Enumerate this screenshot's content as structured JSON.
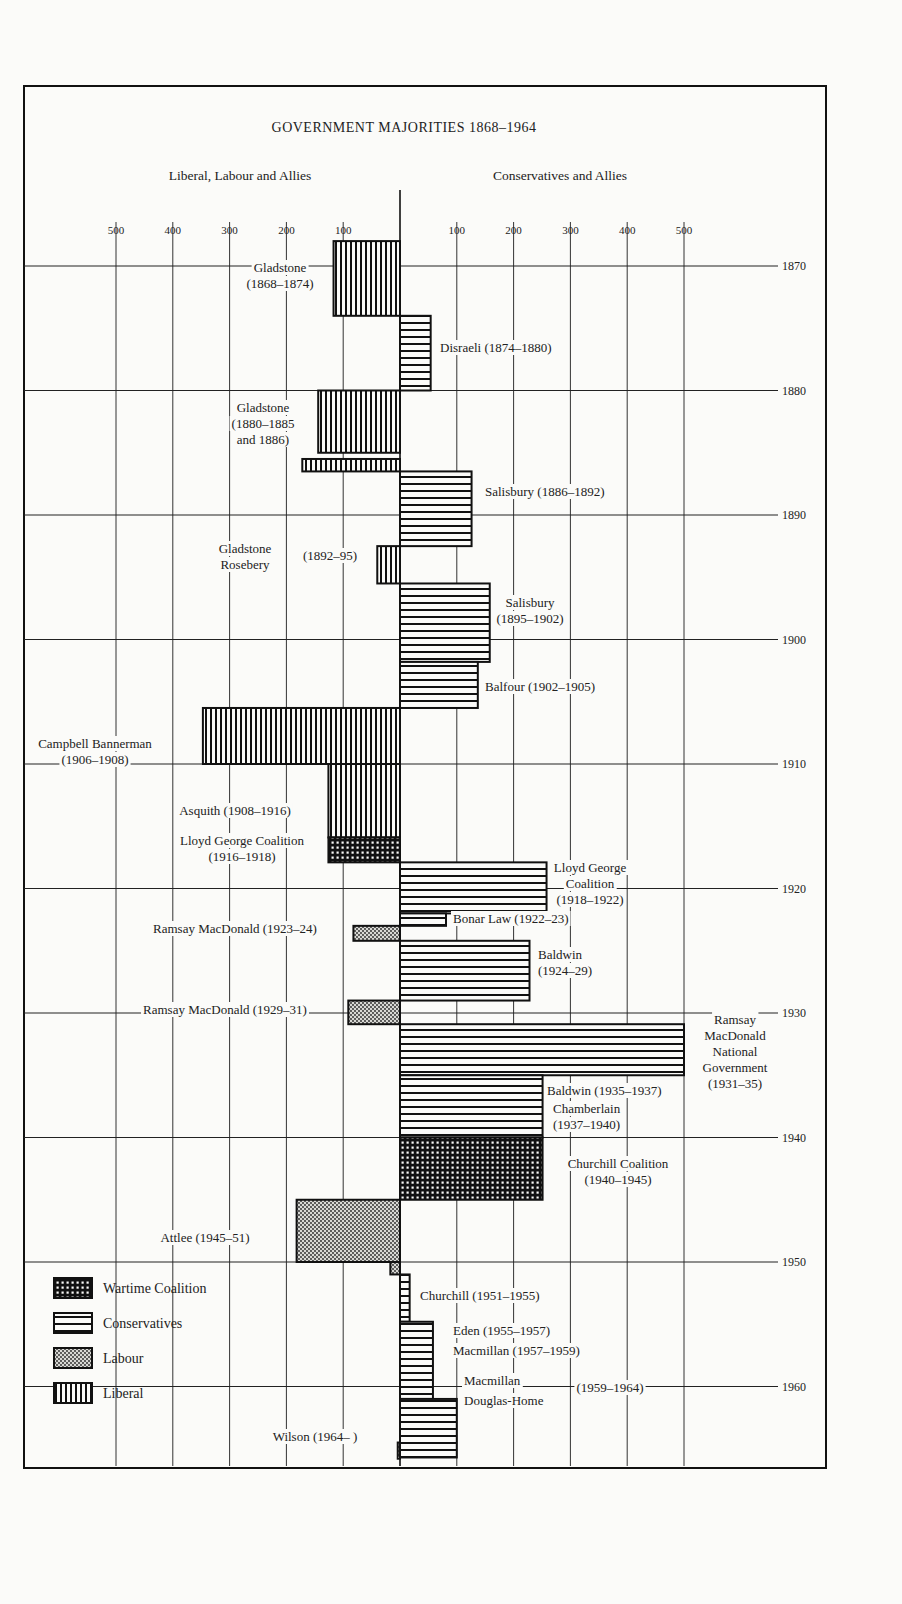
{
  "chart_data": {
    "type": "bar",
    "orientation": "horizontal-diverging",
    "title": "GOVERNMENT MAJORITIES 1868–1964",
    "left_heading": "Liberal, Labour and Allies",
    "right_heading": "Conservatives and Allies",
    "x_ticks_left": [
      500,
      400,
      300,
      200,
      100
    ],
    "x_ticks_right": [
      100,
      200,
      300,
      400,
      500
    ],
    "year_ticks": [
      1870,
      1880,
      1890,
      1900,
      1910,
      1920,
      1930,
      1940,
      1950,
      1960
    ],
    "xlim": [
      -600,
      600
    ],
    "ylim": [
      1868,
      1966
    ],
    "legend": [
      {
        "key": "wartime",
        "label": "Wartime Coalition"
      },
      {
        "key": "conservative",
        "label": "Conservatives"
      },
      {
        "key": "labour",
        "label": "Labour"
      },
      {
        "key": "liberal",
        "label": "Liberal"
      }
    ],
    "bars": [
      {
        "label": "Gladstone (1868–1874)",
        "start": 1868,
        "end": 1874,
        "side": "left",
        "majority": 117,
        "party": "liberal"
      },
      {
        "label": "Disraeli (1874–1880)",
        "start": 1874,
        "end": 1880,
        "side": "right",
        "majority": 54,
        "party": "conservative"
      },
      {
        "label": "Gladstone (1880–1885 and 1886)",
        "start": 1880,
        "end": 1885,
        "side": "left",
        "majority": 144,
        "party": "liberal"
      },
      {
        "label": "Gladstone (1886)",
        "start": 1885.5,
        "end": 1886.5,
        "side": "left",
        "majority": 172,
        "party": "liberal"
      },
      {
        "label": "Salisbury (1886–1892)",
        "start": 1886.5,
        "end": 1892.5,
        "side": "right",
        "majority": 126,
        "party": "conservative"
      },
      {
        "label": "Gladstone Rosebery (1892–95)",
        "start": 1892.5,
        "end": 1895.5,
        "side": "left",
        "majority": 40,
        "party": "liberal"
      },
      {
        "label": "Salisbury (1895–1902)",
        "start": 1895.5,
        "end": 1901.8,
        "side": "right",
        "majority": 158,
        "party": "conservative"
      },
      {
        "label": "Balfour (1902–1905)",
        "start": 1901.8,
        "end": 1905.5,
        "side": "right",
        "majority": 137,
        "party": "conservative"
      },
      {
        "label": "Campbell Bannerman (1906–1908)",
        "start": 1905.5,
        "end": 1910,
        "side": "left",
        "majority": 347,
        "party": "liberal"
      },
      {
        "label": "Asquith (1908–1916)",
        "start": 1910,
        "end": 1915.9,
        "side": "left",
        "majority": 126,
        "party": "liberal"
      },
      {
        "label": "Lloyd George Coalition (1916–1918)",
        "start": 1915.9,
        "end": 1917.9,
        "side": "left",
        "majority": 126,
        "party": "wartime"
      },
      {
        "label": "Lloyd George Coalition (1918–1922)",
        "start": 1917.9,
        "end": 1922,
        "side": "right",
        "majority": 258,
        "party": "conservative"
      },
      {
        "label": "Bonar Law (1922–23)",
        "start": 1922,
        "end": 1923,
        "side": "right",
        "majority": 81,
        "party": "conservative"
      },
      {
        "label": "Ramsay MacDonald (1923–24)",
        "start": 1923,
        "end": 1924.2,
        "side": "left",
        "majority": 82,
        "party": "labour"
      },
      {
        "label": "Baldwin (1924–29)",
        "start": 1924.2,
        "end": 1929,
        "side": "right",
        "majority": 228,
        "party": "conservative"
      },
      {
        "label": "Ramsay MacDonald (1929–31)",
        "start": 1929,
        "end": 1930.9,
        "side": "left",
        "majority": 91,
        "party": "labour"
      },
      {
        "label": "Ramsay MacDonald National Government (1931–35)",
        "start": 1930.9,
        "end": 1935,
        "side": "right",
        "majority": 500,
        "party": "conservative"
      },
      {
        "label": "Baldwin (1935–1937) Chamberlain (1937–1940)",
        "start": 1935,
        "end": 1940,
        "side": "right",
        "majority": 251,
        "party": "conservative"
      },
      {
        "label": "Churchill Coalition (1940–1945)",
        "start": 1940,
        "end": 1945,
        "side": "right",
        "majority": 251,
        "party": "wartime"
      },
      {
        "label": "Attlee (1945–51)",
        "start": 1945,
        "end": 1950,
        "side": "left",
        "majority": 182,
        "party": "labour"
      },
      {
        "label": "Attlee (1950–51)",
        "start": 1950,
        "end": 1951,
        "side": "left",
        "majority": 17,
        "party": "labour"
      },
      {
        "label": "Churchill (1951–1955)",
        "start": 1951,
        "end": 1954.8,
        "side": "right",
        "majority": 17,
        "party": "conservative"
      },
      {
        "label": "Eden (1955–1957) Macmillan (1957–1959)",
        "start": 1954.8,
        "end": 1961,
        "side": "right",
        "majority": 58,
        "party": "conservative"
      },
      {
        "label": "Macmillan Douglas-Home (1959–1964)",
        "start": 1961,
        "end": 1965.7,
        "side": "right",
        "majority": 100,
        "party": "conservative"
      },
      {
        "label": "Wilson (1964– )",
        "start": 1964.5,
        "end": 1965.8,
        "side": "left",
        "majority": 4,
        "party": "labour"
      }
    ]
  },
  "annotations": {
    "gladstone_1868": [
      "Gladstone",
      "(1868–1874)"
    ],
    "disraeli": "Disraeli (1874–1880)",
    "gladstone_1880": [
      "Gladstone",
      "(1880–1885",
      "and 1886)"
    ],
    "salisbury_1886": "Salisbury (1886–1892)",
    "gladstone_rosebery": [
      "Gladstone",
      "Rosebery"
    ],
    "gladstone_rosebery_years": "(1892–95)",
    "salisbury_1895": [
      "Salisbury",
      "(1895–1902)"
    ],
    "balfour": "Balfour (1902–1905)",
    "campbell": [
      "Campbell Bannerman",
      "(1906–1908)"
    ],
    "asquith": "Asquith (1908–1916)",
    "lg_wartime": [
      "Lloyd George Coalition",
      "(1916–1918)"
    ],
    "lg_coalition": [
      "Lloyd George",
      "Coalition",
      "(1918–1922)"
    ],
    "bonar_law": "Bonar Law (1922–23)",
    "macdonald_1923": "Ramsay MacDonald (1923–24)",
    "baldwin_1924": [
      "Baldwin",
      "(1924–29)"
    ],
    "macdonald_1929": "Ramsay MacDonald (1929–31)",
    "national": [
      "Ramsay",
      "MacDonald",
      "National",
      "Government",
      "(1931–35)"
    ],
    "baldwin_1935": "Baldwin (1935–1937)",
    "chamberlain": [
      "Chamberlain",
      "(1937–1940)"
    ],
    "churchill_coalition": [
      "Churchill Coalition",
      "(1940–1945)"
    ],
    "attlee": "Attlee (1945–51)",
    "churchill_1951": "Churchill (1951–1955)",
    "eden": "Eden (1955–1957)",
    "macmillan_1957": "Macmillan (1957–1959)",
    "macmillan_1959": [
      "Macmillan",
      "Douglas-Home"
    ],
    "macmillan_1959_years": "(1959–1964)",
    "wilson": "Wilson (1964– )"
  }
}
